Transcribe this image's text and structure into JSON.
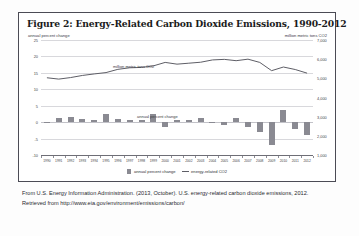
{
  "figure": {
    "title": "Figure 2: Energy-Related Carbon Dioxide Emissions, 1990-2012",
    "left_axis_units": "annual percent change",
    "right_axis_units": "million metric tons CO2",
    "inner_label_line": "million metric tons CO2",
    "inner_label_bars": "annual percent change"
  },
  "legend": {
    "items": [
      {
        "label": "annual percent change",
        "marker": "square-swatch",
        "color": "#8a8a92"
      },
      {
        "label": "energy-related CO2",
        "marker": "line-swatch",
        "color": "#5e5e66"
      }
    ]
  },
  "caption": {
    "text": "From U.S. Energy Information Administration. (2013, October). U.S. energy-related carbon dioxide emissions, 2012. Retrieved from http://www.eia.gov/environment/emissions/carbon/"
  },
  "chart_data": {
    "type": "bar",
    "title": "Figure 2: Energy-Related Carbon Dioxide Emissions, 1990-2012",
    "xlabel": "",
    "ylabel": "annual percent change",
    "y2label": "million metric tons CO2",
    "grid": true,
    "legend_position": "bottom-center",
    "categories": [
      "1990",
      "1991",
      "1992",
      "1993",
      "1994",
      "1995",
      "1996",
      "1997",
      "1998",
      "1999",
      "2000",
      "2001",
      "2002",
      "2003",
      "2004",
      "2005",
      "2006",
      "2007",
      "2008",
      "2009",
      "2010",
      "2011",
      "2012"
    ],
    "left_axis": {
      "ticks": [
        -10,
        -5,
        0,
        5,
        10,
        15,
        20,
        25
      ],
      "ylim": [
        -10,
        25
      ],
      "tick_labels": [
        "-10",
        "-5",
        "0",
        "5",
        "10",
        "15",
        "20",
        "25"
      ]
    },
    "right_axis": {
      "ticks": [
        1000,
        2000,
        3000,
        4000,
        5000,
        6000,
        7000
      ],
      "ylim": [
        1000,
        7000
      ],
      "tick_labels": [
        "1,000",
        "2,000",
        "3,000",
        "4,000",
        "5,000",
        "6,000",
        "7,000"
      ]
    },
    "series": [
      {
        "name": "annual percent change",
        "type": "bar",
        "axis": "left",
        "color": "#8a8a92",
        "values": [
          -0.4,
          1.3,
          1.6,
          0.9,
          0.8,
          2.6,
          1.0,
          0.8,
          0.6,
          2.5,
          -1.6,
          0.7,
          0.6,
          1.2,
          -0.2,
          -0.8,
          1.2,
          -1.4,
          -3.0,
          -7.1,
          3.8,
          -2.2,
          -3.8
        ]
      },
      {
        "name": "energy-related CO2",
        "type": "line",
        "axis": "right",
        "color": "#5e5e66",
        "values": [
          5030,
          4960,
          5040,
          5150,
          5230,
          5300,
          5470,
          5550,
          5570,
          5650,
          5830,
          5740,
          5790,
          5840,
          5960,
          5990,
          5920,
          6000,
          5830,
          5400,
          5590,
          5460,
          5270
        ]
      }
    ]
  }
}
